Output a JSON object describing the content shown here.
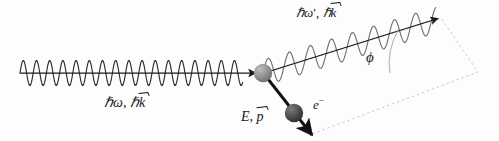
{
  "figure": {
    "name": "compton-scattering-diagram",
    "background_color": "#fdfdfd",
    "width": 499,
    "height": 141
  },
  "labels": {
    "incident_photon": {
      "text_plain": "ℏω, ℏk⃗",
      "hbar": "ℏ",
      "omega": "ω",
      "comma": ",",
      "hbar2": "ℏ",
      "k": "k"
    },
    "scattered_photon": {
      "text_plain": "ℏω′, ℏk⃗",
      "hbar": "ℏ",
      "omega": "ω",
      "prime": "′",
      "comma": ",",
      "hbar2": "ℏ",
      "k": "k"
    },
    "electron_momentum": {
      "text_plain": "E, p⃗",
      "energy": "E",
      "comma": ",",
      "p": "p"
    },
    "electron_particle": {
      "text_plain": "e⁻",
      "symbol": "e",
      "charge": "−"
    },
    "scattering_angle": {
      "text_plain": "ϕ",
      "symbol": "ϕ"
    }
  },
  "elements": {
    "incident_wave": {
      "name": "incident-photon-wave",
      "color": "#2b2b2b",
      "axis_y": 73,
      "x_start": 20,
      "x_end": 243,
      "amplitude": 25,
      "wavelength": 13.2
    },
    "incident_arrow": {
      "name": "incident-photon-arrow",
      "color": "#1a1a1a",
      "from": [
        20,
        73
      ],
      "to": [
        258,
        73
      ]
    },
    "scattered_wave": {
      "name": "scattered-photon-wave",
      "color": "#6d6d6d",
      "from": [
        263,
        73
      ],
      "to": [
        436,
        20
      ],
      "amplitude": 26,
      "wavelength": 22
    },
    "scattered_arrow": {
      "name": "scattered-photon-arrow",
      "color": "#1a1a1a",
      "from": [
        263,
        73
      ],
      "to": [
        441,
        17
      ]
    },
    "electron_arrow": {
      "name": "recoil-electron-arrow",
      "color": "#111111",
      "from": [
        263,
        73
      ],
      "to": [
        314,
        138
      ]
    },
    "vertex_sphere": {
      "name": "scattering-vertex-sphere",
      "color": "#8f8f8f",
      "center": [
        263,
        73
      ],
      "radius": 9
    },
    "electron_sphere": {
      "name": "electron-sphere",
      "color": "#4a4a4a",
      "center": [
        294,
        113
      ],
      "radius": 9
    },
    "dashed_plane": {
      "name": "reference-plane-outline",
      "color": "#c9c9c9",
      "points": [
        [
          265,
          73
        ],
        [
          441,
          18
        ],
        [
          478,
          72
        ],
        [
          312,
          134
        ]
      ]
    },
    "angle_arc": {
      "name": "scattering-angle-arc",
      "color": "#9a9a9a",
      "from": [
        398,
        29
      ],
      "to": [
        390,
        73
      ]
    }
  },
  "colors": {
    "ink": "#1a1a1a",
    "wave_incident": "#2b2b2b",
    "wave_scattered": "#6d6d6d",
    "dashed": "#c9c9c9",
    "vertex_sphere": "#8f8f8f",
    "electron_sphere": "#4a4a4a",
    "background": "#fdfdfd"
  }
}
